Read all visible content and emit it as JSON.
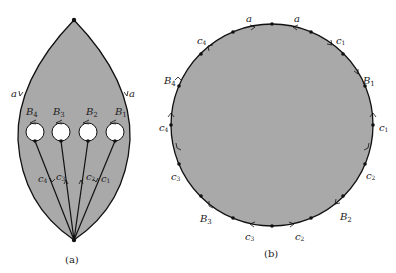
{
  "figure_a": {
    "caption": "(a)",
    "fill_color": "#a9a9a9",
    "edge_labels": {
      "left_side": "a",
      "right_side": "a"
    },
    "boundary_circles": [
      "B4",
      "B3",
      "B2",
      "B1"
    ],
    "curves": [
      "c4",
      "c3",
      "c2",
      "c1"
    ]
  },
  "figure_b": {
    "caption": "(b)",
    "fill_color": "#a9a9a9",
    "edge_labels": [
      "a",
      "a",
      "c1",
      "B1",
      "c1",
      "c2",
      "B2",
      "c2",
      "c3",
      "B3",
      "c3",
      "c4",
      "B4",
      "c4"
    ]
  },
  "labels": {
    "a": "a",
    "B1": "B",
    "B1_sub": "1",
    "B2": "B",
    "B2_sub": "2",
    "B3": "B",
    "B3_sub": "3",
    "B4": "B",
    "B4_sub": "4",
    "c": "c",
    "s1": "1",
    "s2": "2",
    "s3": "3",
    "s4": "4"
  }
}
